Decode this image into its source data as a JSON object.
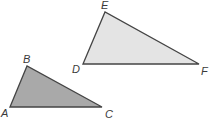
{
  "diagram": {
    "triangles": [
      {
        "name": "ABC",
        "fill": "#a9a9a9",
        "stroke": "#444444",
        "vertices": {
          "A": {
            "label": "A",
            "x": 10,
            "y": 107
          },
          "B": {
            "label": "B",
            "x": 27,
            "y": 66
          },
          "C": {
            "label": "C",
            "x": 102,
            "y": 107
          }
        }
      },
      {
        "name": "DEF",
        "fill": "#e4e4e4",
        "stroke": "#444444",
        "vertices": {
          "D": {
            "label": "D",
            "x": 83,
            "y": 64
          },
          "E": {
            "label": "E",
            "x": 105,
            "y": 12
          },
          "F": {
            "label": "F",
            "x": 199,
            "y": 64
          }
        }
      }
    ]
  }
}
